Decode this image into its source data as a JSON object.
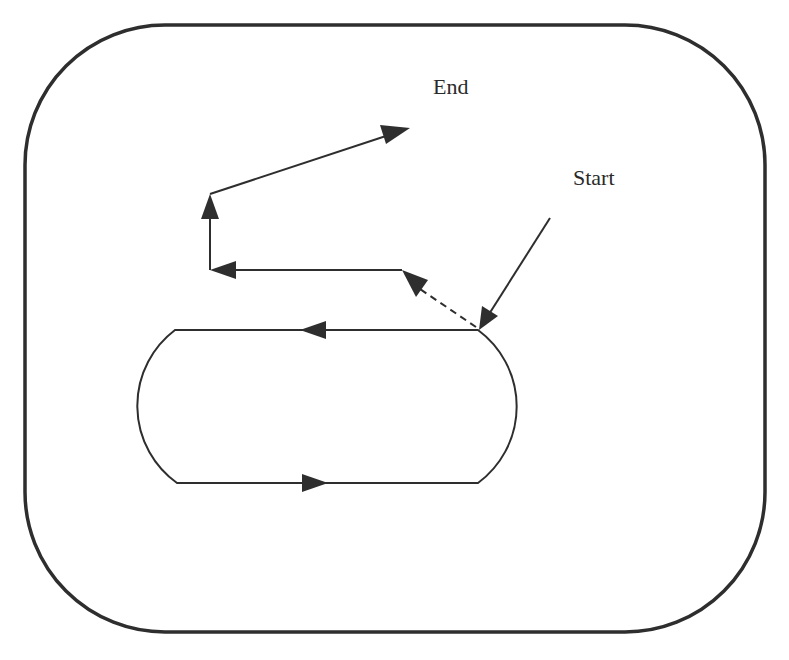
{
  "diagram": {
    "type": "path-trajectory",
    "labels": {
      "end": "End",
      "start": "Start"
    },
    "colors": {
      "ink": "#2e2e2e",
      "background": "#ffffff"
    },
    "elements": {
      "boundary": "rounded-rectangle outer frame",
      "loop": "stadium-shaped closed loop with two directional arrows (top: leftward, bottom: rightward)",
      "start_pointer": "arrow from Start label pointing to top-right corner of loop",
      "dashed_segment": "dashed arrow leaving loop toward upper-left",
      "path_segments": [
        "horizontal segment leftward",
        "vertical segment upward",
        "diagonal segment to End (up-right)"
      ]
    }
  }
}
